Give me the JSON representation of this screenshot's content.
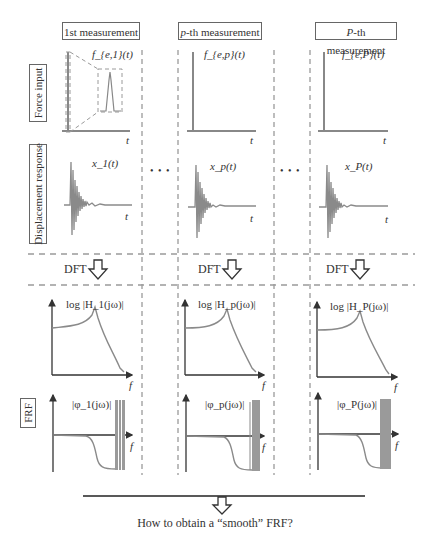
{
  "columns": [
    {
      "title": "1st measurement",
      "force_label": "f_{e,1}(t)",
      "disp_label": "x_1(t)",
      "mag_label": "log |H_1(jω)|",
      "phase_label": "|φ_1(jω)|"
    },
    {
      "title": "p-th measurement",
      "force_label": "f_{e,p}(t)",
      "disp_label": "x_p(t)",
      "mag_label": "log |H_p(jω)|",
      "phase_label": "|φ_p(jω)|"
    },
    {
      "title": "P-th measurement",
      "force_label": "f_{e,P}(t)",
      "disp_label": "x_P(t)",
      "mag_label": "log |H_P(jω)|",
      "phase_label": "|φ_P(jω)|"
    }
  ],
  "rows": {
    "force": "Force input",
    "displacement": "Displacement response",
    "frf": "FRF"
  },
  "dft_label": "DFT",
  "axis_labels": {
    "time": "t",
    "freq": "f"
  },
  "ellipsis": "• • •",
  "question": "How to obtain a “smooth” FRF?",
  "colors": {
    "curve": "#8a8a8a",
    "axis": "#333333",
    "dash": "#9a9a9a",
    "border": "#666666"
  }
}
